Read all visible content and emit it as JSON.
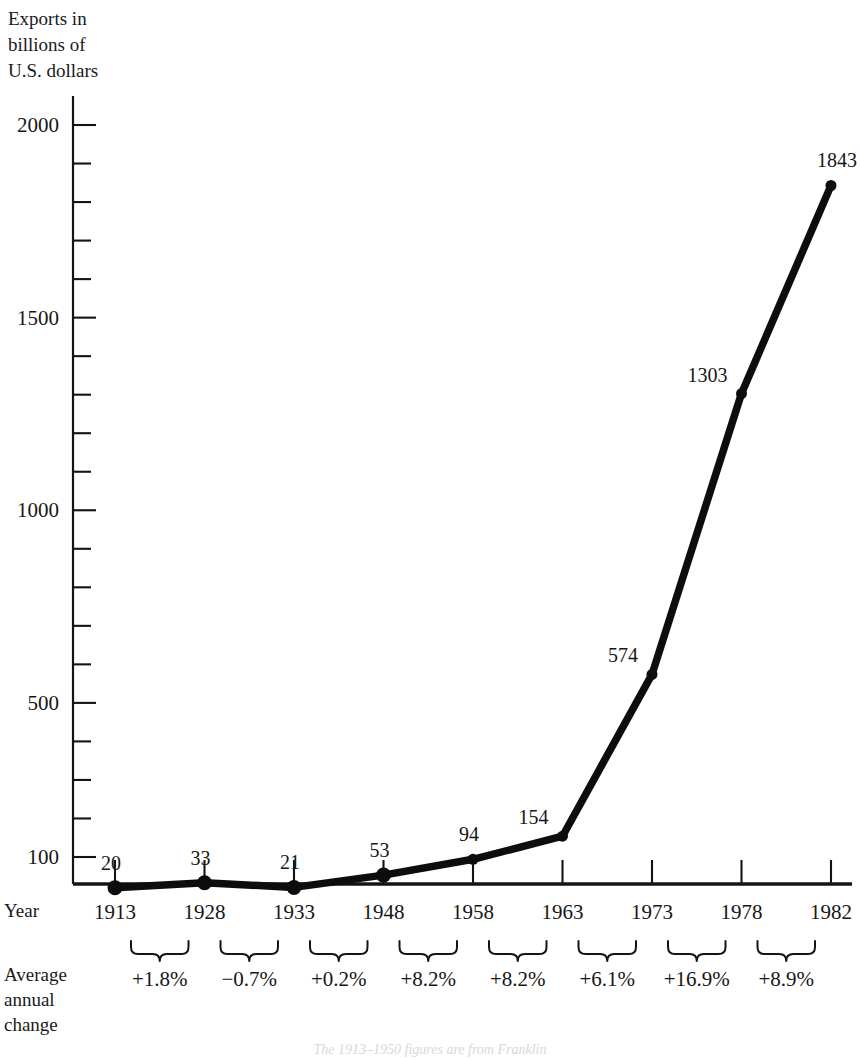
{
  "axis_caption": "Exports in\nbillions of\nU.S. dollars",
  "row_labels": {
    "year": "Year",
    "average": "Average\nannual\nchange"
  },
  "caption_partial": "The 1913–1950 figures are from Franklin",
  "colors": {
    "ink": "#141414",
    "line": "#0d0d0d",
    "background": "#ffffff"
  },
  "chart_data": {
    "type": "line",
    "title": "",
    "xlabel": "Year",
    "ylabel": "Exports in billions of U.S. dollars",
    "categories": [
      "1913",
      "1928",
      "1933",
      "1948",
      "1958",
      "1963",
      "1973",
      "1978",
      "1982"
    ],
    "values": [
      20,
      33,
      21,
      53,
      94,
      154,
      574,
      1303,
      1843
    ],
    "point_labels": [
      "20",
      "33",
      "21",
      "53",
      "94",
      "154",
      "574",
      "1303",
      "1843"
    ],
    "ytick_labels": [
      "100",
      "500",
      "1000",
      "1500",
      "2000"
    ],
    "ytick_values": [
      100,
      500,
      1000,
      1500,
      2000
    ],
    "yminor_step": 100,
    "ylim": [
      30,
      2040
    ],
    "grid": false,
    "legend": false,
    "annotations": {
      "series_name": "Average annual change",
      "intervals": [
        {
          "from": "1913",
          "to": "1928",
          "label": "+1.8%"
        },
        {
          "from": "1928",
          "to": "1933",
          "label": "-0.7%"
        },
        {
          "from": "1933",
          "to": "1948",
          "label": "+0.2%"
        },
        {
          "from": "1948",
          "to": "1958",
          "label": "+8.2%"
        },
        {
          "from": "1958",
          "to": "1963",
          "label": "+8.2%"
        },
        {
          "from": "1963",
          "to": "1973",
          "label": "+6.1%"
        },
        {
          "from": "1973",
          "to": "1978",
          "label": "+16.9%"
        },
        {
          "from": "1978",
          "to": "1982",
          "label": "+8.9%"
        }
      ]
    }
  }
}
